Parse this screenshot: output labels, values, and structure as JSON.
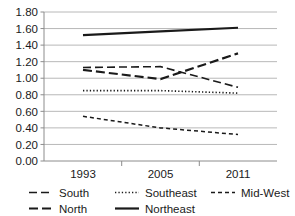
{
  "chart_data": {
    "type": "line",
    "title": "",
    "xlabel": "",
    "ylabel": "",
    "x": [
      "1993",
      "2005",
      "2011"
    ],
    "categories": [
      "1993",
      "2005",
      "2011"
    ],
    "ylim": [
      0.0,
      1.8
    ],
    "yticks": [
      "0.00",
      "0.20",
      "0.40",
      "0.60",
      "0.80",
      "1.00",
      "1.20",
      "1.40",
      "1.60",
      "1.80"
    ],
    "ytick_values": [
      0.0,
      0.2,
      0.4,
      0.6,
      0.8,
      1.0,
      1.2,
      1.4,
      1.6,
      1.8
    ],
    "grid": true,
    "legend_position": "bottom",
    "series": [
      {
        "name": "South",
        "style": "dashed",
        "values": [
          1.13,
          1.14,
          0.89
        ]
      },
      {
        "name": "Southeast",
        "style": "dotted",
        "values": [
          0.85,
          0.85,
          0.82
        ]
      },
      {
        "name": "Mid-West",
        "style": "short-dashed",
        "values": [
          0.54,
          0.4,
          0.32
        ]
      },
      {
        "name": "North",
        "style": "long-dashed",
        "values": [
          1.1,
          0.99,
          1.3
        ]
      },
      {
        "name": "Northeast",
        "style": "solid",
        "values": [
          1.52,
          1.565,
          1.61
        ]
      }
    ]
  },
  "axis": {
    "y_labels": [
      "1.80",
      "1.60",
      "1.40",
      "1.20",
      "1.00",
      "0.80",
      "0.60",
      "0.40",
      "0.20",
      "0.00"
    ],
    "x_labels": [
      "1993",
      "2005",
      "2011"
    ]
  },
  "legend": {
    "row1": [
      {
        "label": "South",
        "style": "dashed"
      },
      {
        "label": "Southeast",
        "style": "dotted"
      },
      {
        "label": "Mid-West",
        "style": "short-dashed"
      }
    ],
    "row2": [
      {
        "label": "North",
        "style": "long-dashed"
      },
      {
        "label": "Northeast",
        "style": "solid"
      }
    ]
  },
  "colors": {
    "line": "#1a1a1a",
    "grid": "#a6a6a6",
    "axis": "#8c8c8c",
    "background": "#ffffff"
  }
}
